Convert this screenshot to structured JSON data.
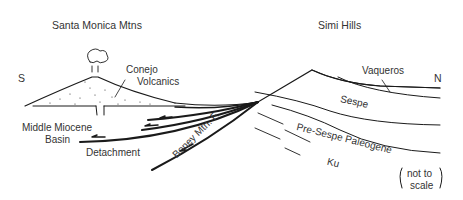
{
  "diagram": {
    "title_left": "Santa Monica Mtns",
    "title_right": "Simi Hills",
    "compass": {
      "south": "S",
      "north": "N"
    },
    "labels": {
      "conejo_1": "Conejo",
      "conejo_2": "Volcanics",
      "mm_1": "Middle Miocene",
      "mm_2": "Basin",
      "detachment": "Detachment",
      "boney": "Boney Mtn. F.",
      "vaqueros": "Vaqueros",
      "sespe": "Sespe",
      "pre_sespe": "Pre-Sespe Paleogene",
      "ku": "Ku",
      "not_to": "not to",
      "scale": "scale"
    },
    "colors": {
      "line": "#1a1a1a",
      "text": "#333333"
    }
  }
}
